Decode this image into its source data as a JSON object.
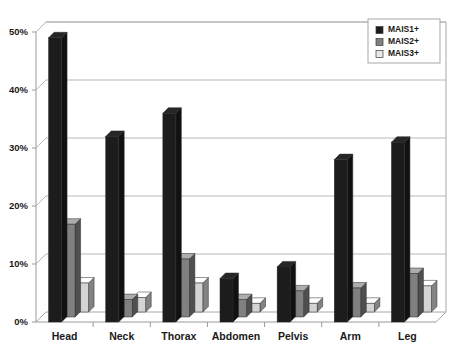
{
  "chart_data": {
    "type": "bar",
    "title": "",
    "subtitle": "",
    "xlabel": "",
    "ylabel": "",
    "categories": [
      "Head",
      "Neck",
      "Thorax",
      "Abdomen",
      "Pelvis",
      "Arm",
      "Leg"
    ],
    "series": [
      {
        "name": "MAIS1+",
        "color": "#1c1c1c",
        "values": [
          49,
          32,
          36,
          7.5,
          9.5,
          28,
          31
        ]
      },
      {
        "name": "MAIS2+",
        "color": "#808080",
        "values": [
          16,
          3,
          10,
          3,
          4.5,
          5,
          7.5
        ]
      },
      {
        "name": "MAIS3+",
        "color": "#d4d4d4",
        "values": [
          5,
          2.5,
          5,
          1.5,
          1.5,
          1.5,
          4.5
        ]
      }
    ],
    "ylim": [
      0,
      50
    ],
    "yticks": [
      0,
      10,
      20,
      30,
      40,
      50
    ],
    "ytick_labels": [
      "0%",
      "10%",
      "20%",
      "30%",
      "40%",
      "50%"
    ],
    "grid": true,
    "grid_axis": "y",
    "legend_position": "top-right",
    "style": "3d-column"
  },
  "legend": {
    "entries": [
      {
        "label": "MAIS1+",
        "swatch": "#1c1c1c"
      },
      {
        "label": "MAIS2+",
        "swatch": "#808080"
      },
      {
        "label": "MAIS3+",
        "swatch": "#e8e8e8"
      }
    ]
  },
  "caption": {
    "text": ""
  },
  "colors": {
    "plot_background": "#ffffff",
    "gridline": "#b8b8b8",
    "axis_line": "#9a9a9a",
    "frame": "#a8a8a8",
    "text": "#1a1a1a",
    "series1": "#1c1c1c",
    "series2": "#808080",
    "series3": "#d4d4d4"
  }
}
